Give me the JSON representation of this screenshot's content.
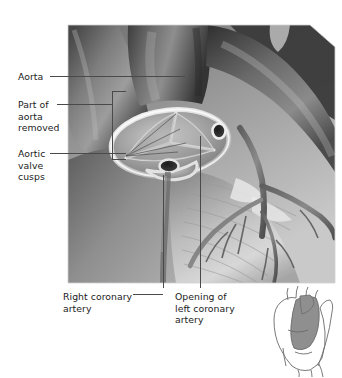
{
  "figure": {
    "style": "grayscale medical illustration",
    "colors": {
      "leader_line": "#4a4a4a",
      "label_text": "#1b1b1b",
      "background": "#ffffff",
      "illustration_dark": "#3c3c3c",
      "illustration_mid": "#8a8a8a",
      "illustration_light": "#d8d8d8",
      "inset_shade": "#8f8f8f",
      "inset_outline": "#6b6b6b"
    },
    "main_image": {
      "x": 68,
      "y": 25,
      "width": 267,
      "height": 258
    },
    "inset_image": {
      "x": 262,
      "y": 290,
      "width": 76,
      "height": 86
    }
  },
  "labels": {
    "aorta": "Aorta",
    "part_of_aorta_removed": "Part of\naorta\nremoved",
    "aortic_valve_cusps": "Aortic\nvalve\ncusps",
    "right_coronary_artery": "Right coronary\nartery",
    "opening_left_coronary_artery": "Opening of\nleft coronary\nartery"
  },
  "leaders": [
    {
      "name": "aorta-leader",
      "from": [
        50,
        76
      ],
      "to": [
        185,
        76
      ]
    },
    {
      "name": "part-of-aorta-leader",
      "from": [
        57,
        104
      ],
      "to": [
        112,
        104
      ]
    },
    {
      "name": "part-of-aorta-bracket-top",
      "from": [
        112,
        91
      ],
      "to": [
        125,
        91
      ]
    },
    {
      "name": "part-of-aorta-bracket-bottom",
      "from": [
        112,
        159
      ],
      "to": [
        125,
        159
      ]
    },
    {
      "name": "aortic-cusps-leader",
      "from": [
        50,
        153
      ],
      "to": [
        126,
        153
      ]
    },
    {
      "name": "right-coronary-leader-vertical",
      "from": [
        163,
        175
      ],
      "to": [
        163,
        288
      ]
    },
    {
      "name": "right-coronary-leader-horizontal",
      "from": [
        133,
        294
      ],
      "to": [
        163,
        294
      ]
    },
    {
      "name": "left-coronary-leader-vertical",
      "from": [
        200,
        140
      ],
      "to": [
        200,
        288
      ]
    }
  ],
  "anatomy_parts": [
    "aorta",
    "aortic valve cusps",
    "right coronary artery",
    "opening of left coronary artery",
    "pulmonary trunk",
    "coronary vessels on ventricular surface"
  ]
}
